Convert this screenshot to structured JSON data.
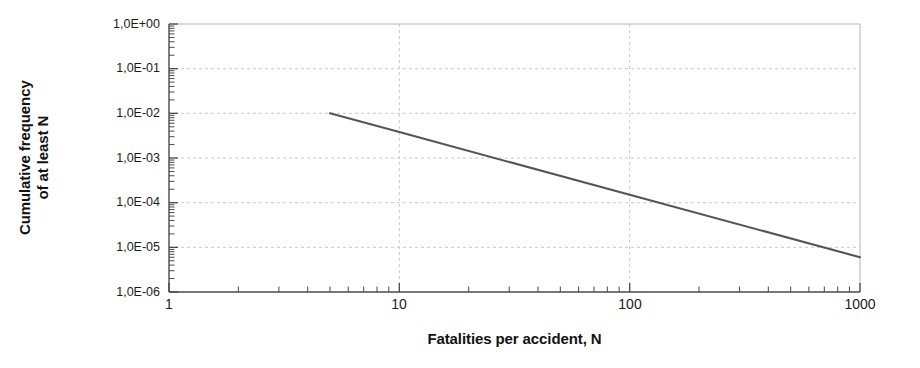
{
  "chart_data": {
    "type": "line",
    "title": "",
    "xlabel": "Fatalities per accident, N",
    "ylabel_lines": [
      "Cumulative frequency",
      "of at least N"
    ],
    "ylabel": "Cumulative frequency of at least N",
    "xscale": "log",
    "yscale": "log",
    "xlim": [
      1,
      1000
    ],
    "ylim": [
      1e-06,
      1
    ],
    "grid": true,
    "legend": "none",
    "xticks": [
      "1",
      "10",
      "100",
      "1000"
    ],
    "xtick_values": [
      1,
      10,
      100,
      1000
    ],
    "yticks": [
      "1,0E+00",
      "1,0E-01",
      "1,0E-02",
      "1,0E-03",
      "1,0E-04",
      "1,0E-05",
      "1,0E-06"
    ],
    "ytick_values": [
      1,
      0.1,
      0.01,
      0.001,
      0.0001,
      1e-05,
      1e-06
    ],
    "series": [
      {
        "name": "FN curve",
        "color": "#555555",
        "x": [
          5,
          10,
          100,
          1000
        ],
        "y": [
          0.01,
          0.0038,
          0.00015,
          6e-06
        ]
      }
    ],
    "annotations": []
  },
  "style": {
    "line_color": "#555555",
    "grid_color": "#c9c9c9",
    "axis_color": "#4a4a4a",
    "border_color": "#b4b4b4",
    "background": "#ffffff"
  },
  "icons": {
    "chart_icon": "line-chart-icon"
  }
}
